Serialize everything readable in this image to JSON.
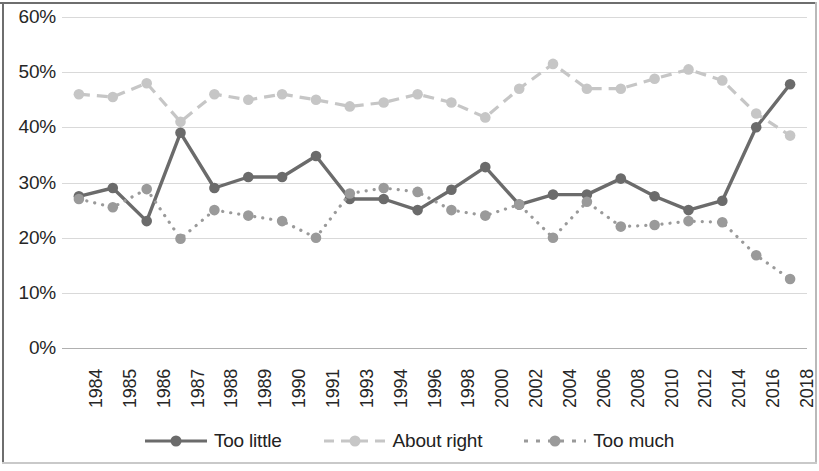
{
  "chart_data": {
    "type": "line",
    "title": "",
    "xlabel": "",
    "ylabel": "",
    "ylim": [
      0,
      60
    ],
    "ytick_labels": [
      "0%",
      "10%",
      "20%",
      "30%",
      "40%",
      "50%",
      "60%"
    ],
    "ytick_values": [
      0,
      10,
      20,
      30,
      40,
      50,
      60
    ],
    "grid": true,
    "legend_position": "bottom",
    "categories": [
      "1984",
      "1985",
      "1986",
      "1987",
      "1988",
      "1989",
      "1990",
      "1991",
      "1993",
      "1994",
      "1996",
      "1998",
      "2000",
      "2002",
      "2004",
      "2006",
      "2008",
      "2010",
      "2012",
      "2014",
      "2016",
      "2018"
    ],
    "series": [
      {
        "name": "Too little",
        "color": "#6b6b6b",
        "style": "solid",
        "values": [
          27.5,
          29.0,
          23.0,
          39.0,
          29.0,
          31.0,
          31.0,
          34.8,
          27.0,
          27.0,
          25.0,
          28.7,
          32.8,
          26.0,
          27.8,
          27.8,
          30.7,
          27.5,
          25.0,
          26.7,
          40.0,
          47.8
        ]
      },
      {
        "name": "About right",
        "color": "#c6c6c6",
        "style": "dashed",
        "values": [
          46.0,
          45.5,
          48.0,
          41.0,
          46.0,
          45.0,
          46.0,
          45.0,
          43.8,
          44.5,
          46.0,
          44.5,
          41.8,
          47.0,
          51.5,
          47.0,
          47.0,
          48.8,
          50.5,
          48.5,
          42.5,
          38.5
        ]
      },
      {
        "name": "Too much",
        "color": "#9a9a9a",
        "style": "dotted",
        "values": [
          27.0,
          25.5,
          28.8,
          19.8,
          25.0,
          24.0,
          23.0,
          20.0,
          28.0,
          29.0,
          28.3,
          25.0,
          24.0,
          26.0,
          20.0,
          26.5,
          22.0,
          22.3,
          23.0,
          22.8,
          16.8,
          12.5
        ]
      }
    ]
  }
}
